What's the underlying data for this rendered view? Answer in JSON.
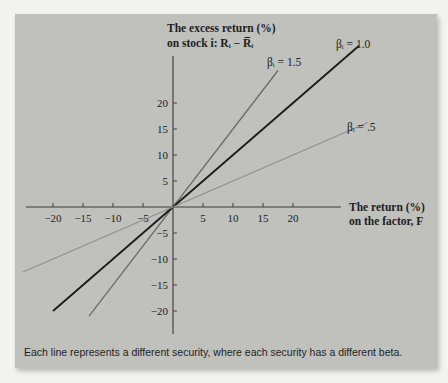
{
  "chart_data": {
    "type": "line",
    "title": "",
    "ylabel_lines": [
      "The excess return (%)",
      "on stock i: Rᵢ − R̅ᵢ"
    ],
    "xlabel_lines": [
      "The return (%)",
      "on the factor, F"
    ],
    "xlim": [
      -25,
      33
    ],
    "ylim": [
      -25,
      33
    ],
    "x_ticks": [
      -20,
      -15,
      -10,
      -5,
      5,
      10,
      15,
      20
    ],
    "y_ticks": [
      20,
      15,
      10,
      5,
      -5,
      -10,
      -15,
      -20
    ],
    "x_tick_labels": [
      "−20",
      "−15",
      "−10",
      "−5",
      "5",
      "10",
      "15",
      "20"
    ],
    "y_tick_labels": [
      "20",
      "15",
      "10",
      "5",
      "−5",
      "−10",
      "−15",
      "−20"
    ],
    "grid": false,
    "series": [
      {
        "name": "βᵢ = 1.5",
        "beta": 1.5,
        "x_range": [
          -14,
          17.5
        ],
        "color": "#6a6a6a"
      },
      {
        "name": "βᵢ = 1.0",
        "beta": 1.0,
        "x_range": [
          -20,
          31
        ],
        "color": "#1a1a1a"
      },
      {
        "name": "βᵢ = .5",
        "beta": 0.5,
        "x_range": [
          -25,
          32.5
        ],
        "color": "#8e8e8e"
      }
    ],
    "caption": "Each line represents a different security, where each security has a different beta."
  }
}
